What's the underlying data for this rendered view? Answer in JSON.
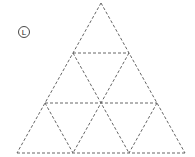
{
  "diagram": {
    "type": "triangular-grid",
    "label": "L",
    "subdivisions": 3,
    "line_color": "#555555",
    "vertices": {
      "apex": [
        101,
        3
      ],
      "bottom_left": [
        17,
        153
      ],
      "bottom_right": [
        185,
        153
      ]
    },
    "edges": [
      [
        [
          101,
          3
        ],
        [
          17,
          153
        ]
      ],
      [
        [
          101,
          3
        ],
        [
          185,
          153
        ]
      ],
      [
        [
          17,
          153
        ],
        [
          185,
          153
        ]
      ],
      [
        [
          73,
          53
        ],
        [
          129,
          53
        ]
      ],
      [
        [
          45,
          103
        ],
        [
          157,
          103
        ]
      ],
      [
        [
          73,
          53
        ],
        [
          129,
          153
        ]
      ],
      [
        [
          45,
          103
        ],
        [
          73,
          153
        ]
      ],
      [
        [
          129,
          53
        ],
        [
          73,
          153
        ]
      ],
      [
        [
          157,
          103
        ],
        [
          129,
          153
        ]
      ]
    ]
  }
}
